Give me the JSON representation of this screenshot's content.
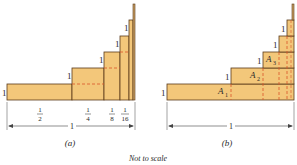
{
  "colors": {
    "fill": "#f3c77a",
    "stroke": "#5a3a1a",
    "dash": "#d9532a",
    "text": "#2a2a2a"
  },
  "panel_a": {
    "caption": "(a)",
    "height_labels": [
      "1",
      "1",
      "1",
      "1",
      "1"
    ],
    "width_labels": [
      {
        "num": "1",
        "den": "2"
      },
      {
        "num": "1",
        "den": "4"
      },
      {
        "num": "1",
        "den": "8"
      },
      {
        "num": "1",
        "den": "16"
      }
    ],
    "total_width_label": "1"
  },
  "panel_b": {
    "caption": "(b)",
    "height_labels": [
      "1",
      "1",
      "1",
      "1",
      "1"
    ],
    "area_labels": [
      {
        "base": "A",
        "sub": "1"
      },
      {
        "base": "A",
        "sub": "2"
      },
      {
        "base": "A",
        "sub": "3"
      }
    ],
    "total_width_label": "1"
  },
  "footer": {
    "note": "Not to scale"
  }
}
